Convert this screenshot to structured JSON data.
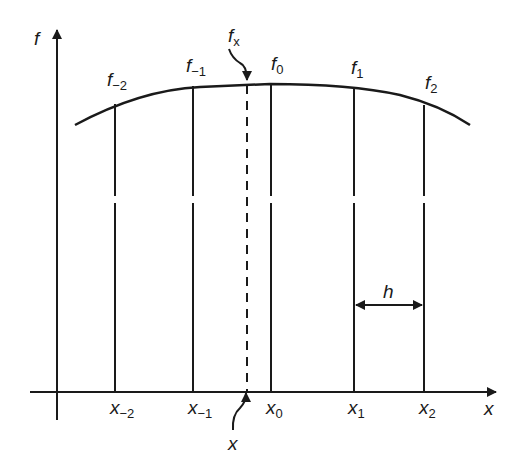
{
  "axes": {
    "y_label": "f",
    "x_label": "x"
  },
  "nodes": [
    {
      "f_base": "f",
      "f_sub": "−2",
      "x_base": "x",
      "x_sub": "−2"
    },
    {
      "f_base": "f",
      "f_sub": "−1",
      "x_base": "x",
      "x_sub": "−1"
    },
    {
      "f_base": "f",
      "f_sub": "0",
      "x_base": "x",
      "x_sub": "0"
    },
    {
      "f_base": "f",
      "f_sub": "1",
      "x_base": "x",
      "x_sub": "1"
    },
    {
      "f_base": "f",
      "f_sub": "2",
      "x_base": "x",
      "x_sub": "2"
    }
  ],
  "interp": {
    "f_base": "f",
    "f_sub": "x",
    "x_label": "x"
  },
  "spacing_label": "h"
}
